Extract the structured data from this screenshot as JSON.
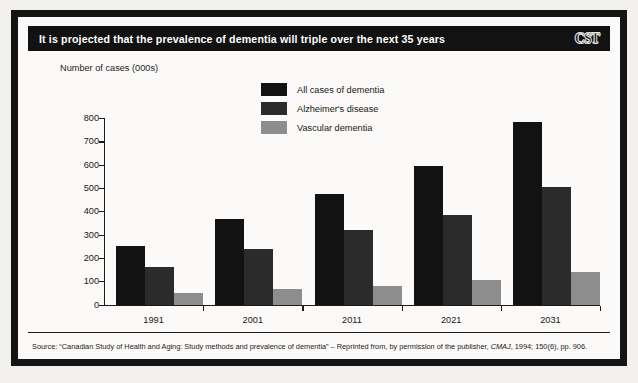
{
  "figure": {
    "title": "It is projected that the prevalence of dementia will triple over the next 35 years",
    "logo": "CST",
    "source": "Source: “Canadian Study of Health and Aging: Study methods and prevalence of dementia” – Reprinted from, by permission of the publisher, ",
    "source_italic": "CMAJ",
    "source_tail": ", 1994; 150(6), pp. 906."
  },
  "colors": {
    "series_all_cases": "#121212",
    "series_alzheimers": "#2b2b2b",
    "series_vascular": "#8d8d8d",
    "frame": "#141414",
    "title_bar_bg": "#121212",
    "title_bar_text": "#ffffff",
    "axis": "#1b1b1b",
    "plot_bg": "#fbfaf8"
  },
  "chart_data": {
    "type": "bar",
    "title": "It is projected that the prevalence of dementia will triple over the next 35 years",
    "xlabel": "",
    "ylabel": "Number of cases (000s)",
    "ylim": [
      0,
      800
    ],
    "yticks": [
      0,
      100,
      200,
      300,
      400,
      500,
      600,
      700,
      800
    ],
    "ytick_labels": [
      "0",
      "100",
      "200",
      "300",
      "400",
      "500",
      "600",
      "700",
      "800"
    ],
    "grid": false,
    "legend_position": "top-center",
    "categories": [
      "1991",
      "2001",
      "2011",
      "2021",
      "2031"
    ],
    "series": [
      {
        "name": "All cases of dementia",
        "color": "#121212",
        "values": [
          250,
          365,
          475,
          595,
          785
        ]
      },
      {
        "name": "Alzheimer's disease",
        "color": "#2b2b2b",
        "values": [
          160,
          240,
          320,
          385,
          505
        ]
      },
      {
        "name": "Vascular dementia",
        "color": "#8d8d8d",
        "values": [
          50,
          65,
          80,
          105,
          140
        ]
      }
    ]
  }
}
